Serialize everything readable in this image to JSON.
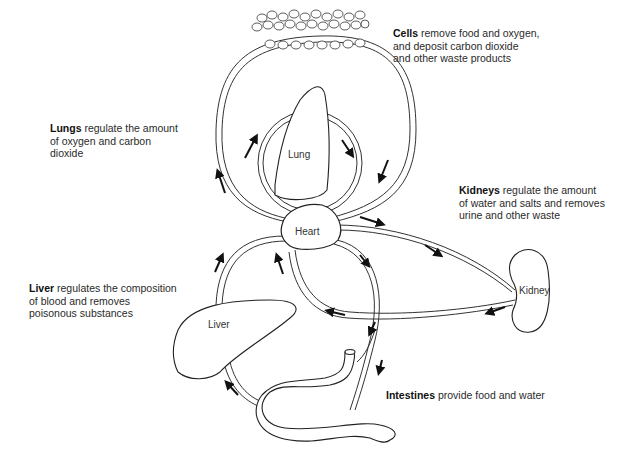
{
  "diagram": {
    "organs": {
      "lung": "Lung",
      "heart": "Heart",
      "kidney": "Kidney",
      "liver": "Liver"
    },
    "captions": {
      "cells": {
        "bold": "Cells",
        "lines": [
          "remove food and oxygen,",
          "and deposit carbon dioxide",
          "and other waste products"
        ]
      },
      "lungs": {
        "bold": "Lungs",
        "lines": [
          "regulate the amount",
          "of oxygen and carbon",
          "dioxide"
        ]
      },
      "kidneys": {
        "bold": "Kidneys",
        "lines": [
          "regulate the amount",
          "of water and salts and removes",
          "urine and other waste"
        ]
      },
      "liver": {
        "bold": "Liver",
        "lines": [
          "regulates the composition",
          "of blood and removes",
          "poisonous substances"
        ]
      },
      "intestines": {
        "bold": "Intestines",
        "lines": [
          "provide food and water"
        ]
      }
    },
    "colors": {
      "line": "#222222",
      "background": "#ffffff",
      "arrow": "#111111"
    }
  }
}
